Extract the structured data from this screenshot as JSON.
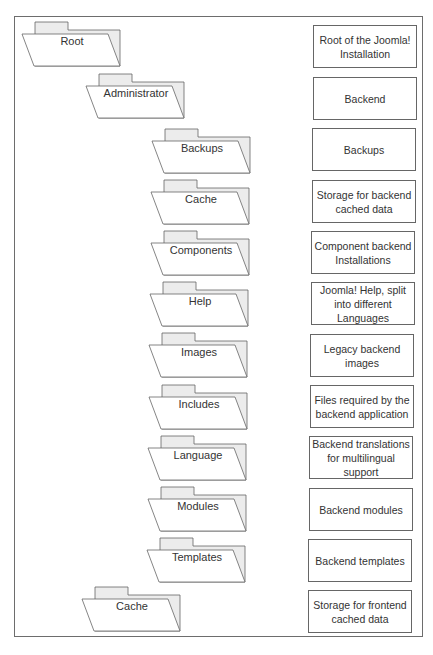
{
  "diagram": {
    "type": "folder-tree",
    "colors": {
      "line": "#666666",
      "folder_back": "#ececec",
      "folder_front": "#ffffff",
      "text": "#333333"
    },
    "folders": [
      {
        "label": "Root",
        "level": 0,
        "description": "Root of the Joomla! Installation"
      },
      {
        "label": "Administrator",
        "level": 1,
        "description": "Backend"
      },
      {
        "label": "Backups",
        "level": 2,
        "description": "Backups"
      },
      {
        "label": "Cache",
        "level": 2,
        "description": "Storage for backend cached data"
      },
      {
        "label": "Components",
        "level": 2,
        "description": "Component backend Installations"
      },
      {
        "label": "Help",
        "level": 2,
        "description": "Joomla! Help, split into different Languages"
      },
      {
        "label": "Images",
        "level": 2,
        "description": "Legacy backend images"
      },
      {
        "label": "Includes",
        "level": 2,
        "description": "Files required by the backend application"
      },
      {
        "label": "Language",
        "level": 2,
        "description": "Backend translations for multilingual support"
      },
      {
        "label": "Modules",
        "level": 2,
        "description": "Backend modules"
      },
      {
        "label": "Templates",
        "level": 2,
        "description": "Backend templates"
      },
      {
        "label": "Cache",
        "level": 1,
        "description": "Storage for frontend cached data"
      }
    ]
  }
}
